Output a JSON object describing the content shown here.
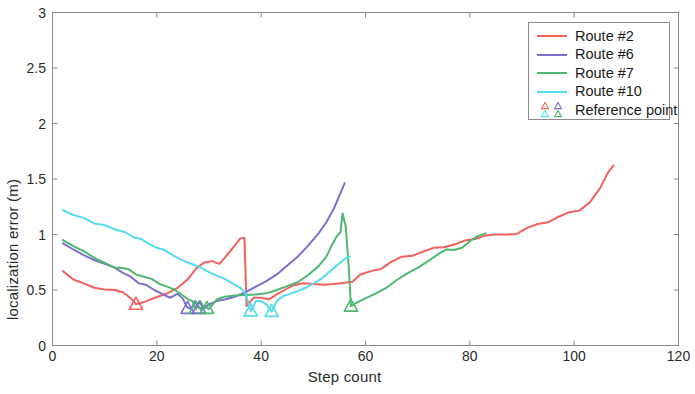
{
  "chart_data": {
    "type": "line",
    "title": "",
    "xlabel": "Step count",
    "ylabel": "localization error (m)",
    "xlim": [
      0,
      120
    ],
    "ylim": [
      0,
      3
    ],
    "xticks": [
      0,
      20,
      40,
      60,
      80,
      100,
      120
    ],
    "yticks": [
      0,
      0.5,
      1,
      1.5,
      2,
      2.5,
      3
    ],
    "xtick_labels": [
      "0",
      "20",
      "40",
      "60",
      "80",
      "100",
      "120"
    ],
    "ytick_labels": [
      "0",
      "0.5",
      "1",
      "1.5",
      "2",
      "2.5",
      "3"
    ],
    "grid": false,
    "legend_position": "upper right",
    "colors": {
      "route2": "#f4605c",
      "route6": "#7b6fd0",
      "route7": "#4cb870",
      "route10": "#53dcee",
      "axis": "#8a8a8a",
      "text": "#2b2b2b"
    },
    "series": [
      {
        "name": "Route #2",
        "color": "#f4605c",
        "points": [
          [
            2.0,
            0.67
          ],
          [
            4.0,
            0.595
          ],
          [
            6.0,
            0.56
          ],
          [
            8.0,
            0.52
          ],
          [
            10.0,
            0.505
          ],
          [
            12.0,
            0.5
          ],
          [
            13.5,
            0.48
          ],
          [
            15.0,
            0.425
          ],
          [
            16.0,
            0.372
          ],
          [
            18.0,
            0.4
          ],
          [
            20.0,
            0.437
          ],
          [
            22.0,
            0.47
          ],
          [
            24.0,
            0.52
          ],
          [
            26.0,
            0.6
          ],
          [
            27.5,
            0.69
          ],
          [
            29.0,
            0.745
          ],
          [
            30.5,
            0.76
          ],
          [
            32.0,
            0.735
          ],
          [
            33.0,
            0.79
          ],
          [
            34.5,
            0.875
          ],
          [
            36.0,
            0.965
          ],
          [
            36.8,
            0.97
          ],
          [
            37.2,
            0.355
          ],
          [
            38.5,
            0.43
          ],
          [
            40.0,
            0.43
          ],
          [
            41.5,
            0.415
          ],
          [
            43.0,
            0.46
          ],
          [
            44.5,
            0.5
          ],
          [
            46.0,
            0.54
          ],
          [
            48.0,
            0.56
          ],
          [
            50.0,
            0.555
          ],
          [
            52.0,
            0.548
          ],
          [
            54.0,
            0.555
          ],
          [
            56.0,
            0.565
          ],
          [
            57.5,
            0.575
          ],
          [
            59.0,
            0.64
          ],
          [
            61.0,
            0.67
          ],
          [
            63.0,
            0.69
          ],
          [
            65.0,
            0.755
          ],
          [
            67.0,
            0.8
          ],
          [
            69.0,
            0.808
          ],
          [
            71.0,
            0.845
          ],
          [
            73.0,
            0.88
          ],
          [
            75.0,
            0.885
          ],
          [
            77.0,
            0.91
          ],
          [
            79.0,
            0.945
          ],
          [
            81.0,
            0.96
          ],
          [
            83.0,
            0.99
          ],
          [
            85.0,
            1.0
          ],
          [
            87.0,
            1.0
          ],
          [
            89.0,
            1.005
          ],
          [
            91.0,
            1.06
          ],
          [
            93.0,
            1.095
          ],
          [
            95.0,
            1.11
          ],
          [
            97.0,
            1.16
          ],
          [
            99.0,
            1.2
          ],
          [
            101.0,
            1.215
          ],
          [
            103.0,
            1.29
          ],
          [
            105.0,
            1.42
          ],
          [
            106.5,
            1.56
          ],
          [
            107.5,
            1.62
          ]
        ]
      },
      {
        "name": "Route #6",
        "color": "#7b6fd0",
        "points": [
          [
            2.0,
            0.92
          ],
          [
            4.0,
            0.865
          ],
          [
            6.0,
            0.815
          ],
          [
            8.0,
            0.77
          ],
          [
            10.0,
            0.735
          ],
          [
            12.0,
            0.7
          ],
          [
            13.5,
            0.655
          ],
          [
            15.0,
            0.62
          ],
          [
            16.5,
            0.56
          ],
          [
            18.0,
            0.545
          ],
          [
            19.5,
            0.5
          ],
          [
            21.0,
            0.465
          ],
          [
            22.5,
            0.43
          ],
          [
            24.0,
            0.465
          ],
          [
            25.0,
            0.42
          ],
          [
            25.8,
            0.345
          ],
          [
            26.6,
            0.33
          ],
          [
            27.3,
            0.4
          ],
          [
            28.0,
            0.342
          ],
          [
            28.8,
            0.33
          ],
          [
            30.0,
            0.37
          ],
          [
            31.5,
            0.4
          ],
          [
            33.0,
            0.415
          ],
          [
            35.0,
            0.44
          ],
          [
            37.0,
            0.48
          ],
          [
            39.0,
            0.53
          ],
          [
            41.0,
            0.58
          ],
          [
            43.0,
            0.64
          ],
          [
            45.0,
            0.72
          ],
          [
            47.0,
            0.8
          ],
          [
            49.0,
            0.9
          ],
          [
            51.0,
            1.01
          ],
          [
            52.5,
            1.11
          ],
          [
            54.0,
            1.24
          ],
          [
            55.0,
            1.35
          ],
          [
            56.0,
            1.462
          ]
        ]
      },
      {
        "name": "Route #7",
        "color": "#4cb870",
        "points": [
          [
            2.0,
            0.95
          ],
          [
            4.0,
            0.895
          ],
          [
            6.0,
            0.85
          ],
          [
            8.0,
            0.79
          ],
          [
            10.0,
            0.745
          ],
          [
            12.0,
            0.7
          ],
          [
            13.0,
            0.7
          ],
          [
            14.5,
            0.69
          ],
          [
            16.0,
            0.64
          ],
          [
            17.5,
            0.62
          ],
          [
            19.0,
            0.6
          ],
          [
            20.5,
            0.555
          ],
          [
            22.0,
            0.53
          ],
          [
            23.5,
            0.5
          ],
          [
            25.0,
            0.45
          ],
          [
            26.0,
            0.415
          ],
          [
            26.8,
            0.4
          ],
          [
            27.5,
            0.33
          ],
          [
            28.3,
            0.4
          ],
          [
            29.0,
            0.345
          ],
          [
            30.0,
            0.33
          ],
          [
            31.5,
            0.415
          ],
          [
            33.0,
            0.44
          ],
          [
            35.0,
            0.45
          ],
          [
            37.0,
            0.455
          ],
          [
            39.0,
            0.46
          ],
          [
            41.0,
            0.47
          ],
          [
            43.0,
            0.5
          ],
          [
            45.0,
            0.535
          ],
          [
            47.0,
            0.57
          ],
          [
            49.0,
            0.635
          ],
          [
            51.0,
            0.715
          ],
          [
            52.5,
            0.8
          ],
          [
            53.5,
            0.9
          ],
          [
            54.5,
            0.985
          ],
          [
            55.2,
            1.02
          ],
          [
            55.6,
            1.19
          ],
          [
            56.2,
            1.075
          ],
          [
            56.8,
            0.7
          ],
          [
            57.2,
            0.355
          ],
          [
            58.5,
            0.39
          ],
          [
            60.0,
            0.425
          ],
          [
            62.0,
            0.47
          ],
          [
            64.0,
            0.52
          ],
          [
            66.0,
            0.59
          ],
          [
            68.0,
            0.65
          ],
          [
            70.0,
            0.7
          ],
          [
            72.0,
            0.76
          ],
          [
            74.0,
            0.825
          ],
          [
            75.5,
            0.865
          ],
          [
            77.0,
            0.86
          ],
          [
            78.5,
            0.88
          ],
          [
            80.0,
            0.94
          ],
          [
            81.5,
            0.985
          ],
          [
            83.0,
            1.01
          ]
        ]
      },
      {
        "name": "Route #10",
        "color": "#53dcee",
        "points": [
          [
            2.0,
            1.22
          ],
          [
            4.0,
            1.175
          ],
          [
            6.0,
            1.15
          ],
          [
            8.0,
            1.1
          ],
          [
            10.0,
            1.085
          ],
          [
            12.0,
            1.045
          ],
          [
            14.0,
            1.02
          ],
          [
            15.5,
            0.975
          ],
          [
            17.0,
            0.96
          ],
          [
            18.5,
            0.915
          ],
          [
            20.0,
            0.88
          ],
          [
            21.5,
            0.86
          ],
          [
            23.0,
            0.815
          ],
          [
            24.0,
            0.79
          ],
          [
            25.5,
            0.755
          ],
          [
            27.0,
            0.73
          ],
          [
            28.5,
            0.7
          ],
          [
            30.0,
            0.66
          ],
          [
            31.5,
            0.63
          ],
          [
            33.0,
            0.6
          ],
          [
            34.5,
            0.56
          ],
          [
            36.0,
            0.52
          ],
          [
            37.0,
            0.47
          ],
          [
            38.0,
            0.31
          ],
          [
            39.0,
            0.4
          ],
          [
            40.0,
            0.4
          ],
          [
            41.0,
            0.37
          ],
          [
            42.0,
            0.305
          ],
          [
            43.0,
            0.4
          ],
          [
            44.0,
            0.44
          ],
          [
            45.5,
            0.465
          ],
          [
            47.0,
            0.49
          ],
          [
            48.5,
            0.52
          ],
          [
            50.0,
            0.555
          ],
          [
            51.5,
            0.6
          ],
          [
            53.0,
            0.66
          ],
          [
            54.5,
            0.72
          ],
          [
            56.0,
            0.78
          ],
          [
            57.0,
            0.8
          ]
        ]
      }
    ],
    "reference_points": [
      {
        "x": 16.0,
        "y": 0.372,
        "color": "#f4605c"
      },
      {
        "x": 25.9,
        "y": 0.335,
        "color": "#7b6fd0"
      },
      {
        "x": 27.5,
        "y": 0.335,
        "color": "#4cb870"
      },
      {
        "x": 28.1,
        "y": 0.335,
        "color": "#7b6fd0"
      },
      {
        "x": 29.6,
        "y": 0.335,
        "color": "#4cb870"
      },
      {
        "x": 38.0,
        "y": 0.312,
        "color": "#53dcee"
      },
      {
        "x": 42.0,
        "y": 0.308,
        "color": "#53dcee"
      },
      {
        "x": 57.2,
        "y": 0.355,
        "color": "#4cb870"
      }
    ],
    "legend": [
      {
        "label": "Route #2",
        "kind": "line",
        "color": "#f4605c"
      },
      {
        "label": "Route #6",
        "kind": "line",
        "color": "#7b6fd0"
      },
      {
        "label": "Route #7",
        "kind": "line",
        "color": "#4cb870"
      },
      {
        "label": "Route #10",
        "kind": "line",
        "color": "#53dcee"
      },
      {
        "label": "Reference point",
        "kind": "markers",
        "marker_colors": [
          "#f4605c",
          "#7b6fd0",
          "#53dcee",
          "#4cb870"
        ]
      }
    ]
  }
}
